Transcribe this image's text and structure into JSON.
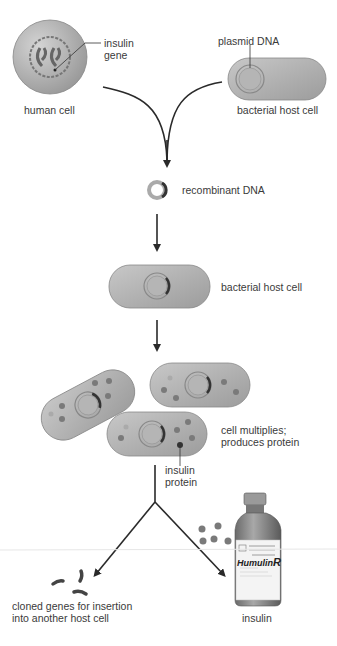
{
  "labels": {
    "insulin_gene": "insulin\ngene",
    "insulin_gene_l1": "insulin",
    "insulin_gene_l2": "gene",
    "plasmid_dna": "plasmid DNA",
    "human_cell": "human cell",
    "bacterial_host_cell_top": "bacterial host cell",
    "recombinant_dna": "recombinant DNA",
    "bacterial_host_cell_mid": "bacterial host cell",
    "cell_multiplies_l1": "cell multiplies;",
    "cell_multiplies_l2": "produces protein",
    "insulin_protein_l1": "insulin",
    "insulin_protein_l2": "protein",
    "cloned_genes_l1": "cloned genes for insertion",
    "cloned_genes_l2": "into another host cell",
    "insulin": "insulin"
  },
  "vial": {
    "brand": "Humulin",
    "brand_suffix": "R"
  },
  "colors": {
    "cell_fill": "#a9a9a9",
    "cell_highlight": "#d0d0d0",
    "arrow": "#2a2a2a",
    "protein_dot": "#7a7a7a",
    "dna_dark": "#333333"
  }
}
